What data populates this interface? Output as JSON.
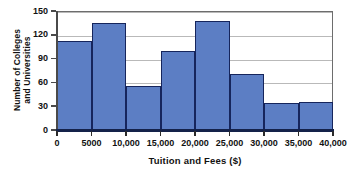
{
  "chart_data": {
    "type": "bar",
    "title": "",
    "xlabel": "Tuition and Fees ($)",
    "ylabel": "Number of Colleges and Universities",
    "ylabel_lines": [
      "Number of Colleges",
      "and Universities"
    ],
    "categories": [
      "0-5000",
      "5000-10,000",
      "10,000-15,000",
      "15,000-20,000",
      "20,000-25,000",
      "25,000-30,000",
      "30,000-35,000",
      "35,000-40,000"
    ],
    "bin_edges": [
      0,
      5000,
      10000,
      15000,
      20000,
      25000,
      30000,
      35000,
      40000
    ],
    "values": [
      112,
      135,
      56,
      100,
      137,
      71,
      34,
      35
    ],
    "bin_width": 5000,
    "xlim": [
      0,
      40000
    ],
    "ylim": [
      0,
      150
    ],
    "ytick_values": [
      0,
      30,
      60,
      90,
      120,
      150
    ],
    "ytick_labels": [
      "0",
      "30",
      "60",
      "90",
      "120",
      "150"
    ],
    "xtick_values": [
      0,
      5000,
      10000,
      15000,
      20000,
      25000,
      30000,
      35000,
      40000
    ],
    "xtick_labels": [
      "0",
      "5000",
      "10,000",
      "15,000",
      "20,000",
      "25,000",
      "30,000",
      "35,000",
      "40,000"
    ],
    "grid": true,
    "grid_axis": "y",
    "legend": false,
    "bar_fill_color": "#5c7ec4",
    "bar_edge_color": "#16255c",
    "gridline_color": "#b9b9b9",
    "axis_color": "#14224a"
  }
}
